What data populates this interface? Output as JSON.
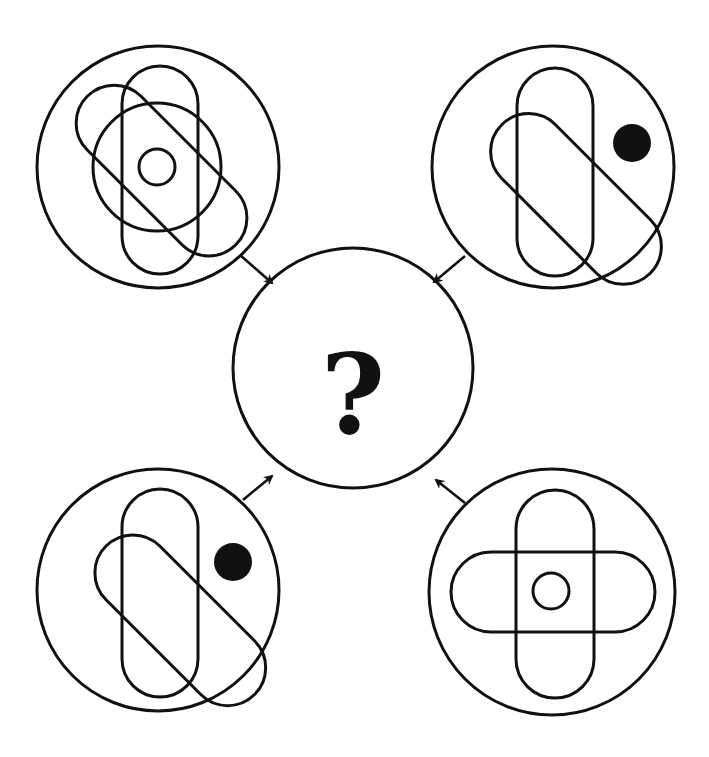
{
  "colors": {
    "stroke": "#111111",
    "background": "#ffffff",
    "fill": "#111111"
  },
  "center": {
    "label": "?",
    "description": "unknown result figure"
  },
  "panels": [
    {
      "id": "top-left",
      "elements": [
        "outer circle",
        "vertical rounded bar",
        "diagonal rounded bar",
        "large inner circle",
        "small center ring"
      ]
    },
    {
      "id": "top-right",
      "elements": [
        "outer circle",
        "vertical rounded bar",
        "diagonal rounded bar",
        "filled black dot"
      ]
    },
    {
      "id": "bottom-left",
      "elements": [
        "outer circle",
        "vertical rounded bar",
        "diagonal rounded bar",
        "filled black dot"
      ]
    },
    {
      "id": "bottom-right",
      "elements": [
        "outer circle",
        "vertical rounded bar",
        "horizontal rounded bar",
        "small center ring"
      ]
    }
  ],
  "arrows": [
    "top-left to center",
    "top-right to center",
    "bottom-left to center",
    "bottom-right to center"
  ]
}
